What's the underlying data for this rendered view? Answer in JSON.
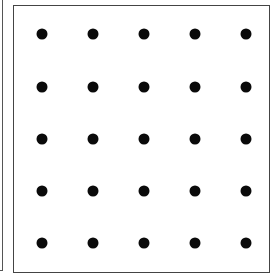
{
  "diagram": {
    "type": "dot-grid",
    "rows": 5,
    "columns": 5,
    "dot_color": "#0a0a0a",
    "border_color": "#444444",
    "background_color": "#ffffff",
    "dot_centers_x": [
      42,
      93,
      144,
      195,
      246
    ],
    "dot_centers_y": [
      34,
      87,
      139,
      191,
      243
    ]
  }
}
